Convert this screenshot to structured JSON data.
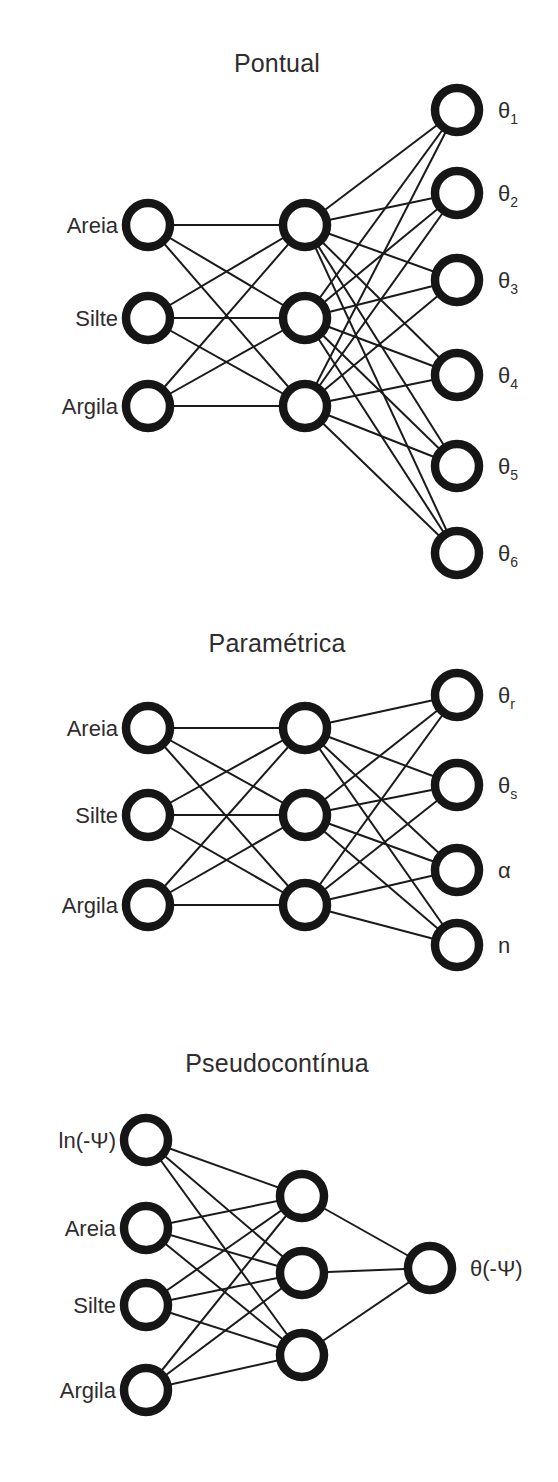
{
  "figure": {
    "background_color": "#ffffff",
    "ink_color": "#161616",
    "text_color": "#2f2c2d"
  },
  "networks": [
    {
      "id": "pontual",
      "title": "Pontual",
      "title_pos": {
        "x": 277,
        "y": 72
      },
      "layers": {
        "input": {
          "x": 148,
          "r": 22,
          "nodes": [
            {
              "label": "Areia",
              "y": 225,
              "label_x": 118
            },
            {
              "label": "Silte",
              "y": 318,
              "label_x": 118
            },
            {
              "label": "Argila",
              "y": 406,
              "label_x": 118
            }
          ]
        },
        "hidden": {
          "x": 305,
          "r": 22,
          "nodes": [
            {
              "label": "",
              "y": 225
            },
            {
              "label": "",
              "y": 318
            },
            {
              "label": "",
              "y": 406
            }
          ]
        },
        "output": {
          "x": 457,
          "r": 22,
          "label_x": 498,
          "nodes": [
            {
              "base": "θ",
              "sub": "1",
              "y": 110
            },
            {
              "base": "θ",
              "sub": "2",
              "y": 193
            },
            {
              "base": "θ",
              "sub": "3",
              "y": 280
            },
            {
              "base": "θ",
              "sub": "4",
              "y": 375
            },
            {
              "base": "θ",
              "sub": "5",
              "y": 466
            },
            {
              "base": "θ",
              "sub": "6",
              "y": 553
            }
          ]
        }
      }
    },
    {
      "id": "parametrica",
      "title": "Paramétrica",
      "title_pos": {
        "x": 277,
        "y": 52
      },
      "layers": {
        "input": {
          "x": 148,
          "r": 22,
          "nodes": [
            {
              "label": "Areia",
              "y": 128,
              "label_x": 118
            },
            {
              "label": "Silte",
              "y": 215,
              "label_x": 118
            },
            {
              "label": "Argila",
              "y": 305,
              "label_x": 118
            }
          ]
        },
        "hidden": {
          "x": 305,
          "r": 22,
          "nodes": [
            {
              "label": "",
              "y": 128
            },
            {
              "label": "",
              "y": 215
            },
            {
              "label": "",
              "y": 305
            }
          ]
        },
        "output": {
          "x": 457,
          "r": 22,
          "label_x": 498,
          "nodes": [
            {
              "base": "θ",
              "sub": "r",
              "y": 95
            },
            {
              "base": "θ",
              "sub": "s",
              "y": 185
            },
            {
              "base": "α",
              "sub": "",
              "y": 270
            },
            {
              "base": "n",
              "sub": "",
              "y": 345
            }
          ]
        }
      }
    },
    {
      "id": "pseudocontinua",
      "title": "Pseudocontínua",
      "title_pos": {
        "x": 277,
        "y": 52
      },
      "layers": {
        "input": {
          "x": 146,
          "r": 22,
          "nodes": [
            {
              "label": "ln(-Ψ)",
              "y": 120,
              "label_x": 116
            },
            {
              "label": "Areia",
              "y": 208,
              "label_x": 116
            },
            {
              "label": "Silte",
              "y": 285,
              "label_x": 116
            },
            {
              "label": "Argila",
              "y": 370,
              "label_x": 116
            }
          ]
        },
        "hidden": {
          "x": 302,
          "r": 22,
          "nodes": [
            {
              "label": "",
              "y": 176
            },
            {
              "label": "",
              "y": 253
            },
            {
              "label": "",
              "y": 335
            }
          ]
        },
        "output": {
          "x": 430,
          "r": 22,
          "label_x": 470,
          "nodes": [
            {
              "base": "θ(-Ψ)",
              "sub": "",
              "y": 248
            }
          ]
        }
      }
    }
  ]
}
